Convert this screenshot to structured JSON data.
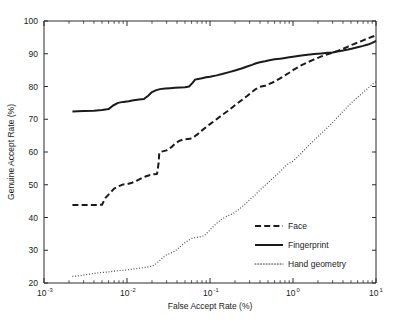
{
  "chart_data": {
    "type": "line",
    "title": "",
    "xlabel": "False Accept Rate (%)",
    "ylabel": "Genuine Accept Rate (%)",
    "xscale": "log",
    "yscale": "linear",
    "xlim": [
      0.001,
      10
    ],
    "ylim": [
      20,
      100
    ],
    "grid": false,
    "legend_position": "lower right",
    "x_tick_labels": [
      "10-3",
      "10-2",
      "10-1",
      "100",
      "101"
    ],
    "x_tick_bases": [
      "10",
      "10",
      "10",
      "10",
      "10"
    ],
    "x_tick_exponents": [
      "-3",
      "-2",
      "-1",
      "0",
      "1"
    ],
    "x_tick_values": [
      0.001,
      0.01,
      0.1,
      1,
      10
    ],
    "y_tick_labels": [
      "20",
      "30",
      "40",
      "50",
      "60",
      "70",
      "80",
      "90",
      "100"
    ],
    "y_tick_values": [
      20,
      30,
      40,
      50,
      60,
      70,
      80,
      90,
      100
    ],
    "series": [
      {
        "name": "Face",
        "style": "dashed",
        "color": "#1a1a1a",
        "width": 2.0,
        "points": [
          [
            0.0022,
            43.8
          ],
          [
            0.003,
            43.8
          ],
          [
            0.004,
            43.8
          ],
          [
            0.005,
            43.9
          ],
          [
            0.0055,
            46.0
          ],
          [
            0.0062,
            47.4
          ],
          [
            0.007,
            48.8
          ],
          [
            0.008,
            49.6
          ],
          [
            0.009,
            50.1
          ],
          [
            0.01,
            50.2
          ],
          [
            0.0115,
            50.6
          ],
          [
            0.013,
            51.2
          ],
          [
            0.015,
            52.0
          ],
          [
            0.017,
            52.6
          ],
          [
            0.019,
            53.0
          ],
          [
            0.021,
            53.2
          ],
          [
            0.023,
            53.3
          ],
          [
            0.024,
            56.5
          ],
          [
            0.0245,
            59.8
          ],
          [
            0.026,
            60.1
          ],
          [
            0.03,
            60.5
          ],
          [
            0.034,
            61.4
          ],
          [
            0.038,
            62.6
          ],
          [
            0.042,
            63.3
          ],
          [
            0.047,
            63.8
          ],
          [
            0.054,
            64.0
          ],
          [
            0.06,
            64.1
          ],
          [
            0.07,
            65.3
          ],
          [
            0.08,
            66.6
          ],
          [
            0.09,
            67.6
          ],
          [
            0.1,
            68.5
          ],
          [
            0.12,
            70.0
          ],
          [
            0.14,
            71.3
          ],
          [
            0.17,
            72.8
          ],
          [
            0.2,
            74.3
          ],
          [
            0.24,
            75.8
          ],
          [
            0.28,
            77.1
          ],
          [
            0.32,
            78.3
          ],
          [
            0.36,
            79.3
          ],
          [
            0.4,
            79.9
          ],
          [
            0.46,
            80.2
          ],
          [
            0.52,
            80.8
          ],
          [
            0.6,
            81.5
          ],
          [
            0.7,
            82.5
          ],
          [
            0.8,
            83.4
          ],
          [
            0.9,
            84.2
          ],
          [
            1.0,
            85.0
          ],
          [
            1.2,
            86.2
          ],
          [
            1.5,
            87.4
          ],
          [
            1.8,
            88.3
          ],
          [
            2.2,
            89.2
          ],
          [
            2.6,
            89.8
          ],
          [
            3.0,
            90.3
          ],
          [
            3.4,
            90.8
          ],
          [
            4.0,
            91.5
          ],
          [
            4.6,
            92.2
          ],
          [
            5.2,
            92.8
          ],
          [
            6.0,
            93.4
          ],
          [
            7.0,
            94.1
          ],
          [
            8.0,
            94.7
          ],
          [
            9.0,
            95.2
          ],
          [
            10.0,
            95.6
          ]
        ]
      },
      {
        "name": "Fingerprint",
        "style": "solid",
        "color": "#1a1a1a",
        "width": 2.0,
        "points": [
          [
            0.0022,
            72.4
          ],
          [
            0.003,
            72.5
          ],
          [
            0.004,
            72.6
          ],
          [
            0.005,
            72.8
          ],
          [
            0.0055,
            73.0
          ],
          [
            0.006,
            73.1
          ],
          [
            0.0068,
            74.2
          ],
          [
            0.0078,
            75.0
          ],
          [
            0.009,
            75.3
          ],
          [
            0.0105,
            75.5
          ],
          [
            0.012,
            75.8
          ],
          [
            0.014,
            76.0
          ],
          [
            0.016,
            76.2
          ],
          [
            0.018,
            77.2
          ],
          [
            0.02,
            78.3
          ],
          [
            0.0225,
            78.9
          ],
          [
            0.025,
            79.2
          ],
          [
            0.029,
            79.4
          ],
          [
            0.033,
            79.5
          ],
          [
            0.038,
            79.6
          ],
          [
            0.044,
            79.7
          ],
          [
            0.05,
            79.8
          ],
          [
            0.056,
            80.0
          ],
          [
            0.062,
            81.2
          ],
          [
            0.066,
            82.1
          ],
          [
            0.072,
            82.3
          ],
          [
            0.08,
            82.5
          ],
          [
            0.09,
            82.8
          ],
          [
            0.1,
            83.0
          ],
          [
            0.12,
            83.4
          ],
          [
            0.14,
            83.8
          ],
          [
            0.17,
            84.4
          ],
          [
            0.2,
            84.9
          ],
          [
            0.24,
            85.5
          ],
          [
            0.28,
            86.1
          ],
          [
            0.32,
            86.6
          ],
          [
            0.36,
            87.1
          ],
          [
            0.4,
            87.4
          ],
          [
            0.46,
            87.7
          ],
          [
            0.52,
            88.0
          ],
          [
            0.6,
            88.3
          ],
          [
            0.7,
            88.5
          ],
          [
            0.8,
            88.7
          ],
          [
            0.9,
            88.9
          ],
          [
            1.0,
            89.1
          ],
          [
            1.2,
            89.4
          ],
          [
            1.5,
            89.7
          ],
          [
            1.8,
            89.9
          ],
          [
            2.2,
            90.1
          ],
          [
            2.6,
            90.3
          ],
          [
            3.0,
            90.4
          ],
          [
            3.4,
            90.7
          ],
          [
            4.0,
            91.0
          ],
          [
            4.6,
            91.3
          ],
          [
            5.2,
            91.6
          ],
          [
            6.0,
            92.0
          ],
          [
            7.0,
            92.4
          ],
          [
            8.0,
            92.8
          ],
          [
            9.0,
            93.3
          ],
          [
            10.0,
            93.9
          ]
        ]
      },
      {
        "name": "Hand geometry",
        "style": "dotted",
        "color": "#3a3a3a",
        "width": 1.2,
        "points": [
          [
            0.0022,
            22.0
          ],
          [
            0.0028,
            22.3
          ],
          [
            0.0035,
            22.7
          ],
          [
            0.0042,
            23.0
          ],
          [
            0.005,
            23.2
          ],
          [
            0.006,
            23.4
          ],
          [
            0.007,
            23.6
          ],
          [
            0.008,
            23.8
          ],
          [
            0.009,
            23.9
          ],
          [
            0.01,
            24.0
          ],
          [
            0.0115,
            24.2
          ],
          [
            0.013,
            24.4
          ],
          [
            0.015,
            24.6
          ],
          [
            0.017,
            24.8
          ],
          [
            0.019,
            25.0
          ],
          [
            0.021,
            25.4
          ],
          [
            0.024,
            26.5
          ],
          [
            0.027,
            27.8
          ],
          [
            0.03,
            28.6
          ],
          [
            0.034,
            29.2
          ],
          [
            0.038,
            29.8
          ],
          [
            0.043,
            30.9
          ],
          [
            0.048,
            32.0
          ],
          [
            0.054,
            32.9
          ],
          [
            0.06,
            33.6
          ],
          [
            0.068,
            33.9
          ],
          [
            0.076,
            34.1
          ],
          [
            0.085,
            34.4
          ],
          [
            0.095,
            35.6
          ],
          [
            0.105,
            36.8
          ],
          [
            0.12,
            38.2
          ],
          [
            0.14,
            39.6
          ],
          [
            0.16,
            40.4
          ],
          [
            0.19,
            41.2
          ],
          [
            0.22,
            42.4
          ],
          [
            0.26,
            43.9
          ],
          [
            0.3,
            45.4
          ],
          [
            0.35,
            46.9
          ],
          [
            0.4,
            48.4
          ],
          [
            0.46,
            49.8
          ],
          [
            0.52,
            51.0
          ],
          [
            0.6,
            52.4
          ],
          [
            0.7,
            54.0
          ],
          [
            0.8,
            55.6
          ],
          [
            0.9,
            56.6
          ],
          [
            1.0,
            57.2
          ],
          [
            1.15,
            58.6
          ],
          [
            1.3,
            60.0
          ],
          [
            1.5,
            61.7
          ],
          [
            1.8,
            63.6
          ],
          [
            2.1,
            65.2
          ],
          [
            2.5,
            67.0
          ],
          [
            3.0,
            69.0
          ],
          [
            3.5,
            70.8
          ],
          [
            4.0,
            72.4
          ],
          [
            4.6,
            74.0
          ],
          [
            5.2,
            75.3
          ],
          [
            6.0,
            76.7
          ],
          [
            7.0,
            78.2
          ],
          [
            8.0,
            79.5
          ],
          [
            9.0,
            80.6
          ],
          [
            10.0,
            81.5
          ]
        ]
      }
    ]
  },
  "legend": {
    "entries": [
      {
        "label": "Face",
        "style": "dashed"
      },
      {
        "label": "Fingerprint",
        "style": "solid"
      },
      {
        "label": "Hand geometry",
        "style": "dotted"
      }
    ]
  }
}
